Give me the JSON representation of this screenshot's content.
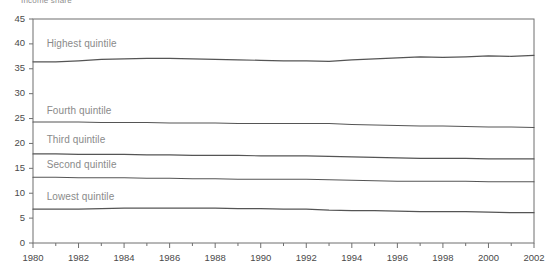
{
  "title": "Income share",
  "chart_data": {
    "type": "line",
    "title": "Income share",
    "xlabel": "",
    "ylabel": "",
    "xlim": [
      1980,
      2002
    ],
    "ylim": [
      0,
      45
    ],
    "ytick_step": 5,
    "yticks": [
      "0",
      "5",
      "10",
      "15",
      "20",
      "25",
      "30",
      "35",
      "40",
      "45"
    ],
    "xticks": [
      "1980",
      "1982",
      "1984",
      "1986",
      "1988",
      "1990",
      "1992",
      "1994",
      "1996",
      "1998",
      "2000",
      "2002"
    ],
    "xtick_minor_step": 1,
    "grid": false,
    "legend_position": "inline-above-line",
    "line_color": "#555555",
    "axis_color": "#6f6f6f",
    "x": [
      1980,
      1981,
      1982,
      1983,
      1984,
      1985,
      1986,
      1987,
      1988,
      1989,
      1990,
      1991,
      1992,
      1993,
      1994,
      1995,
      1996,
      1997,
      1998,
      1999,
      2000,
      2001,
      2002
    ],
    "series": [
      {
        "name": "Highest quintile",
        "label": "Highest quintile",
        "label_x": 1980.6,
        "label_y": 40.0,
        "values": [
          36.4,
          36.4,
          36.6,
          36.9,
          37.0,
          37.1,
          37.1,
          37.0,
          36.9,
          36.8,
          36.7,
          36.6,
          36.6,
          36.5,
          36.8,
          37.0,
          37.2,
          37.4,
          37.3,
          37.4,
          37.6,
          37.5,
          37.7
        ]
      },
      {
        "name": "Fourth quintile",
        "label": "Fourth quintile",
        "label_x": 1980.6,
        "label_y": 26.6,
        "values": [
          24.3,
          24.3,
          24.3,
          24.2,
          24.2,
          24.2,
          24.1,
          24.1,
          24.1,
          24.0,
          24.0,
          24.0,
          24.0,
          24.0,
          23.8,
          23.7,
          23.6,
          23.5,
          23.5,
          23.4,
          23.3,
          23.3,
          23.2
        ]
      },
      {
        "name": "Third quintile",
        "label": "Third quintile",
        "label_x": 1980.6,
        "label_y": 20.6,
        "values": [
          17.9,
          17.9,
          17.8,
          17.8,
          17.8,
          17.7,
          17.7,
          17.6,
          17.6,
          17.6,
          17.5,
          17.5,
          17.5,
          17.4,
          17.3,
          17.2,
          17.1,
          17.0,
          17.0,
          17.0,
          16.9,
          16.9,
          16.9
        ]
      },
      {
        "name": "Second quintile",
        "label": "Second quintile",
        "label_x": 1980.6,
        "label_y": 15.6,
        "values": [
          13.2,
          13.2,
          13.1,
          13.1,
          13.1,
          13.0,
          13.0,
          12.9,
          12.9,
          12.8,
          12.8,
          12.8,
          12.8,
          12.7,
          12.6,
          12.5,
          12.4,
          12.4,
          12.4,
          12.4,
          12.3,
          12.3,
          12.3
        ]
      },
      {
        "name": "Lowest quintile",
        "label": "Lowest quintile",
        "label_x": 1980.6,
        "label_y": 9.3,
        "values": [
          6.8,
          6.8,
          6.8,
          6.9,
          7.0,
          7.0,
          7.0,
          7.0,
          7.0,
          6.9,
          6.9,
          6.8,
          6.8,
          6.6,
          6.5,
          6.5,
          6.4,
          6.3,
          6.3,
          6.3,
          6.2,
          6.1,
          6.1
        ]
      }
    ]
  }
}
